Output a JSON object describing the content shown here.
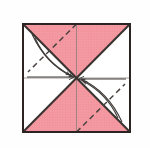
{
  "figure": {
    "name": "origami-fold-diagram",
    "type": "diagram",
    "canvas": {
      "width": 150,
      "height": 148
    },
    "background_color": "#fefefe"
  },
  "colors": {
    "paper_front": "#f59aa3",
    "paper_front_grid": "#ea7f8c",
    "paper_back": "#ffffff",
    "outline": "#2b2422",
    "crease_solid": "#3a3330",
    "crease_dashed": "#4a4240",
    "arrow": "#3d3a38",
    "thin_guide": "#6e6a68"
  },
  "square": {
    "label": "paper-square",
    "left": 23,
    "top": 24,
    "right": 130,
    "bottom": 132,
    "border_width": 2.0
  },
  "center_point": {
    "x": 76.5,
    "y": 78
  },
  "regions": [
    {
      "name": "top-triangle",
      "fill": "paper_front",
      "points": "23,24 130,24 76.5,78"
    },
    {
      "name": "bottom-triangle",
      "fill": "paper_front",
      "points": "23,132 130,132 76.5,78"
    },
    {
      "name": "left-triangle",
      "fill": "paper_back",
      "points": "23,24 23,132 76.5,78"
    },
    {
      "name": "right-triangle",
      "fill": "paper_back",
      "points": "130,24 130,132 76.5,78"
    }
  ],
  "solid_creases": [
    {
      "name": "diagonal-tl-br",
      "x1": 23,
      "y1": 24,
      "x2": 130,
      "y2": 132
    },
    {
      "name": "diagonal-tr-bl",
      "x1": 130,
      "y1": 24,
      "x2": 23,
      "y2": 132
    }
  ],
  "thin_guides": [
    {
      "name": "vertical-midline",
      "x1": 76.5,
      "y1": 24,
      "x2": 76.5,
      "y2": 132
    },
    {
      "name": "horizontal-midline-left",
      "x1": 23,
      "y1": 78,
      "x2": 76.5,
      "y2": 78
    },
    {
      "name": "horizontal-midline-right",
      "x1": 130,
      "y1": 78,
      "x2": 76.5,
      "y2": 78
    }
  ],
  "dashed_creases": [
    {
      "name": "dashed-fold-upper-left",
      "x1": 76.5,
      "y1": 24,
      "x2": 28,
      "y2": 72
    },
    {
      "name": "dashed-fold-lower-right",
      "x1": 76.5,
      "y1": 132,
      "x2": 125,
      "y2": 84
    }
  ],
  "motion_arrows": [
    {
      "name": "fold-arrow-upper-left-outer",
      "path": "M 32,34 C 42,56 58,70 73,77",
      "arrowhead_at": {
        "x": 73,
        "y": 77
      },
      "direction": "to-center"
    },
    {
      "name": "fold-arrow-upper-left-inner",
      "path": "M 35,38 C 44,58 57,68 70,75",
      "arrowhead_at": {
        "x": 70,
        "y": 75
      },
      "direction": "to-center"
    },
    {
      "name": "fold-arrow-lower-right-outer",
      "path": "M 122,122 C 112,100 96,86 81,79",
      "arrowhead_at": {
        "x": 81,
        "y": 79
      },
      "direction": "to-center"
    },
    {
      "name": "fold-arrow-lower-right-inner",
      "path": "M 118,118 C 109,98 96,88 83,81",
      "arrowhead_at": {
        "x": 83,
        "y": 81
      },
      "direction": "to-center"
    }
  ],
  "straight_arrows": [
    {
      "name": "horizontal-arrow-left-to-center",
      "x1": 27,
      "y1": 77,
      "x2": 74,
      "y2": 77,
      "direction": "right"
    },
    {
      "name": "horizontal-arrow-right-to-center",
      "x1": 126,
      "y1": 79,
      "x2": 79,
      "y2": 79,
      "direction": "left"
    }
  ],
  "grid_texture": {
    "name": "paper-grid",
    "cell_size": 2.6,
    "line_color": "#e8838f",
    "opacity": 0.55
  }
}
